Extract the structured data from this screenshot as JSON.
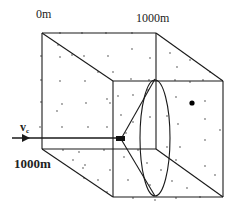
{
  "diagram": {
    "type": "3d-cube-volume",
    "labels": {
      "origin": "0m",
      "top_right": "1000m",
      "front_left": "1000m",
      "velocity_symbol": "v",
      "velocity_subscript": "c"
    },
    "colors": {
      "stroke": "#1a1a1a",
      "scatter_points": "#8a8a8a",
      "target_dot": "#000000",
      "background": "#ffffff"
    },
    "elements": [
      "cube-wireframe",
      "scatter-points",
      "incoming-beam-arrow",
      "cone-sensor",
      "detection-ellipse",
      "target-dot"
    ]
  }
}
